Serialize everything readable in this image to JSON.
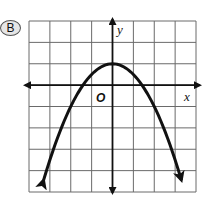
{
  "choice": {
    "label": "B"
  },
  "chart_data": {
    "type": "line",
    "title": "",
    "xlabel": "x",
    "ylabel": "y",
    "origin_label": "O",
    "function": "y = -0.5x^2 + 1",
    "vertex": [
      0,
      1
    ],
    "x_intercepts": [
      -1.41,
      1.41
    ],
    "xlim": [
      -4,
      4
    ],
    "ylim": [
      -5,
      3
    ],
    "grid": true,
    "grid_step": 1,
    "series": [
      {
        "name": "parabola",
        "x": [
          -3.3,
          -3,
          -2,
          -1,
          0,
          1,
          2,
          3,
          3.3
        ],
        "y": [
          -4.45,
          -3.5,
          -1,
          0.5,
          1,
          0.5,
          -1,
          -3.5,
          -4.45
        ]
      }
    ],
    "arrows_on_curve_ends": true,
    "legend": null
  }
}
